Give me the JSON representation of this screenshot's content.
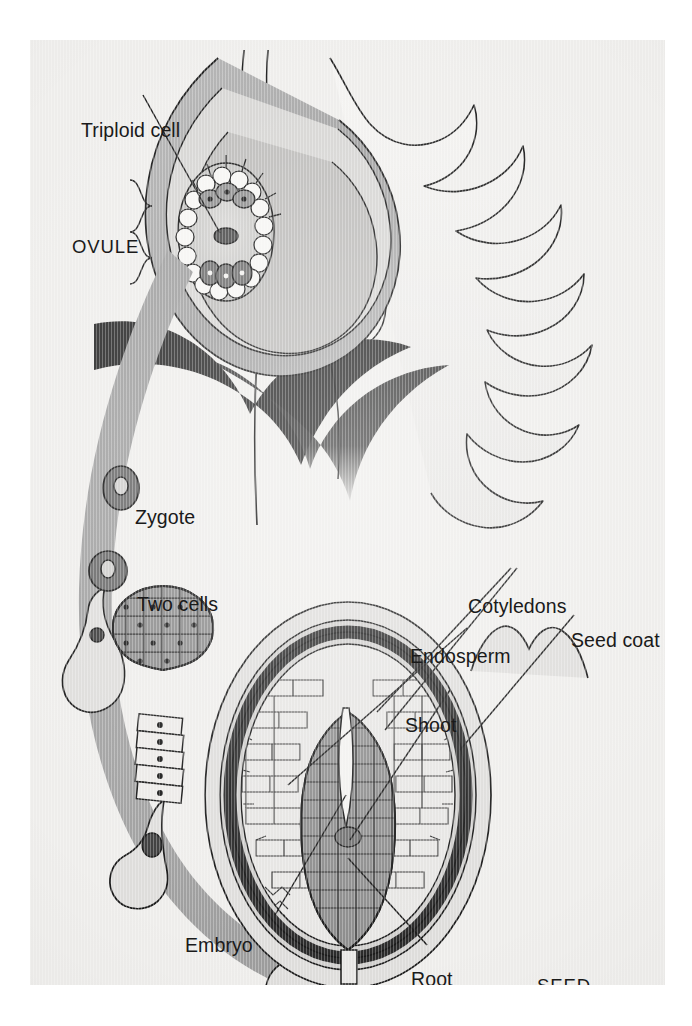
{
  "figure": {
    "background_color": "#eeedeb",
    "ink_color": "#1a1a1a"
  },
  "palette": {
    "paper": "#eeedeb",
    "ink": "#1a1a1a",
    "arrow_gray": "#9a9a9a",
    "mid_gray": "#a8a8a8",
    "light_gray": "#cfcfcf",
    "pale_gray": "#e2e1df",
    "dark_gray": "#6f6f6f",
    "near_black": "#2a2a2a",
    "embryo_fill": "#8d8d8d",
    "seed_ring": "#3a3a3a"
  },
  "labels": {
    "triploid_cell": "Triploid cell",
    "ovule": "OVULE",
    "zygote": "Zygote",
    "two_cells": "Two cells",
    "embryo": "Embryo",
    "cotyledons": "Cotyledons",
    "endosperm": "Endosperm",
    "seed_coat": "Seed coat",
    "shoot": "Shoot",
    "root": "Root",
    "seed": "SEED"
  },
  "label_positions": {
    "triploid_cell": {
      "x": 51,
      "y": 81
    },
    "ovule": {
      "x": 42,
      "y": 198
    },
    "zygote": {
      "x": 105,
      "y": 468
    },
    "two_cells": {
      "x": 107,
      "y": 555
    },
    "embryo": {
      "x": 155,
      "y": 896
    },
    "cotyledons": {
      "x": 438,
      "y": 557
    },
    "endosperm": {
      "x": 380,
      "y": 607
    },
    "seed_coat": {
      "x": 541,
      "y": 591
    },
    "shoot": {
      "x": 375,
      "y": 676
    },
    "root": {
      "x": 381,
      "y": 930
    },
    "seed": {
      "x": 507,
      "y": 937
    }
  },
  "structures": {
    "ovule_diagram": {
      "name": "ovule",
      "parts": [
        "integuments",
        "embryo sac",
        "triploid cell",
        "antipodal cells",
        "egg apparatus"
      ]
    },
    "flower": {
      "name": "flower",
      "parts": [
        "petals",
        "style",
        "ovary wall",
        "sepals"
      ]
    },
    "stages": [
      {
        "name": "zygote",
        "order": 1
      },
      {
        "name": "two cells",
        "order": 2
      },
      {
        "name": "globular embryo",
        "order": 3
      },
      {
        "name": "heart stage embryo",
        "order": 4
      },
      {
        "name": "seed",
        "order": 5
      }
    ],
    "seed_diagram": {
      "name": "seed",
      "parts": [
        "seed coat",
        "endosperm",
        "cotyledons",
        "shoot",
        "root"
      ]
    }
  }
}
